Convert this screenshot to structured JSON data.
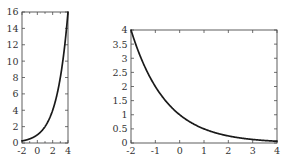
{
  "figure": {
    "background_color": "#ffffff",
    "axis_color": "#4d4d4d",
    "curve_color": "#1a1a1a",
    "tick_label_color": "#333333",
    "panel_count": 2
  },
  "chart_data": [
    {
      "type": "line",
      "id": "left-panel",
      "title": "",
      "xlabel": "",
      "ylabel": "",
      "xlim": [
        -2,
        4
      ],
      "ylim": [
        0,
        16
      ],
      "grid": false,
      "legend": null,
      "xticks": [
        -2,
        0,
        2,
        4
      ],
      "xtick_labels": [
        "-2",
        "0",
        "2",
        "4"
      ],
      "xminorticks": [
        -1,
        1,
        3
      ],
      "yticks": [
        0,
        2,
        4,
        6,
        8,
        10,
        12,
        14,
        16
      ],
      "ytick_labels": [
        "0",
        "2",
        "4",
        "6",
        "8",
        "10",
        "12",
        "14",
        "16"
      ],
      "series": [
        {
          "name": "exponential growth",
          "expression": "y = 2^x",
          "x": [
            -2,
            -1.75,
            -1.5,
            -1.25,
            -1,
            -0.75,
            -0.5,
            -0.25,
            0,
            0.25,
            0.5,
            0.75,
            1,
            1.25,
            1.5,
            1.75,
            2,
            2.25,
            2.5,
            2.75,
            3,
            3.25,
            3.5,
            3.75,
            4
          ],
          "values": [
            0.25,
            0.297,
            0.354,
            0.42,
            0.5,
            0.595,
            0.707,
            0.841,
            1,
            1.189,
            1.414,
            1.682,
            2,
            2.378,
            2.828,
            3.364,
            4,
            4.757,
            5.657,
            6.727,
            8,
            9.514,
            11.314,
            13.454,
            16
          ]
        }
      ]
    },
    {
      "type": "line",
      "id": "right-panel",
      "title": "",
      "xlabel": "",
      "ylabel": "",
      "xlim": [
        -2,
        4
      ],
      "ylim": [
        0,
        4
      ],
      "grid": false,
      "legend": null,
      "xticks": [
        -2,
        -1,
        0,
        1,
        2,
        3,
        4
      ],
      "xtick_labels": [
        "-2",
        "-1",
        "0",
        "1",
        "2",
        "3",
        "4"
      ],
      "yticks": [
        0,
        0.5,
        1,
        1.5,
        2,
        2.5,
        3,
        3.5,
        4
      ],
      "ytick_labels": [
        "0",
        "0.5",
        "1",
        "1.5",
        "2",
        "2.5",
        "3",
        "3.5",
        "4"
      ],
      "series": [
        {
          "name": "exponential decay",
          "expression": "y = 2^(-x)",
          "x": [
            -2,
            -1.75,
            -1.5,
            -1.25,
            -1,
            -0.75,
            -0.5,
            -0.25,
            0,
            0.25,
            0.5,
            0.75,
            1,
            1.25,
            1.5,
            1.75,
            2,
            2.25,
            2.5,
            2.75,
            3,
            3.25,
            3.5,
            3.75,
            4
          ],
          "values": [
            4,
            3.364,
            2.828,
            2.378,
            2,
            1.682,
            1.414,
            1.189,
            1,
            0.841,
            0.707,
            0.595,
            0.5,
            0.42,
            0.354,
            0.297,
            0.25,
            0.21,
            0.177,
            0.149,
            0.125,
            0.105,
            0.088,
            0.074,
            0.0625
          ]
        }
      ]
    }
  ],
  "layout": {
    "left_panel": {
      "x": 22,
      "y": 12,
      "width": 46,
      "height": 131
    },
    "right_panel": {
      "x": 131,
      "y": 30,
      "width": 146,
      "height": 113
    }
  }
}
